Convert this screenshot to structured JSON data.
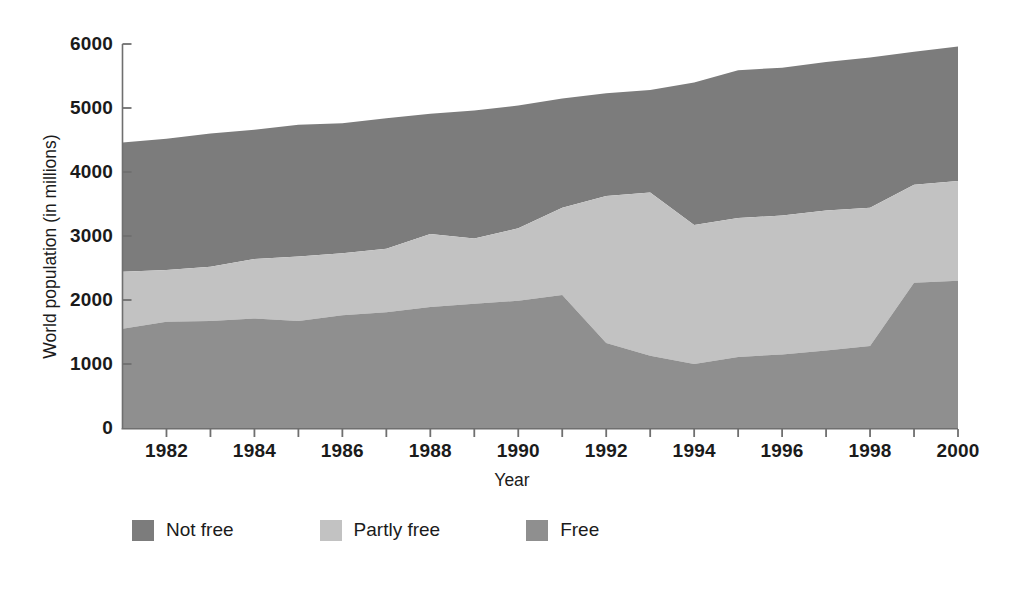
{
  "chart_data": {
    "type": "area",
    "title": "",
    "subtitle": "",
    "xlabel": "Year",
    "ylabel": "World population (in millions)",
    "stacked": true,
    "grid": false,
    "legend_position": "bottom",
    "xlim": [
      1981,
      2000
    ],
    "ylim": [
      0,
      6000
    ],
    "x_tick_labels": [
      "1982",
      "1984",
      "1986",
      "1988",
      "1990",
      "1992",
      "1994",
      "1996",
      "1998",
      "2000"
    ],
    "x_tick_values": [
      1982,
      1984,
      1986,
      1988,
      1990,
      1992,
      1994,
      1996,
      1998,
      2000
    ],
    "x_minor_tick_values": [
      1982,
      1983,
      1984,
      1985,
      1986,
      1987,
      1988,
      1989,
      1990,
      1991,
      1992,
      1993,
      1994,
      1995,
      1996,
      1997,
      1998,
      1999,
      2000
    ],
    "y_tick_labels": [
      "0",
      "1000",
      "2000",
      "3000",
      "4000",
      "5000",
      "6000"
    ],
    "y_tick_values": [
      0,
      1000,
      2000,
      3000,
      4000,
      5000,
      6000
    ],
    "x": [
      1981,
      1982,
      1983,
      1984,
      1985,
      1986,
      1987,
      1988,
      1989,
      1990,
      1991,
      1992,
      1993,
      1994,
      1995,
      1996,
      1997,
      1998,
      1999,
      2000
    ],
    "series": [
      {
        "name": "Free",
        "color": "#8f8f8f",
        "stack_order": 1,
        "values": [
          1550,
          1660,
          1670,
          1710,
          1670,
          1760,
          1810,
          1890,
          1940,
          1990,
          2080,
          1330,
          1130,
          1000,
          1110,
          1150,
          1210,
          1280,
          2270,
          2300
        ]
      },
      {
        "name": "Partly free",
        "color": "#c2c2c2",
        "stack_order": 2,
        "values": [
          890,
          810,
          850,
          930,
          1010,
          970,
          990,
          1140,
          1020,
          1130,
          1360,
          2295,
          2550,
          2170,
          2170,
          2170,
          2190,
          2160,
          1530,
          1560
        ]
      },
      {
        "name": "Not free",
        "color": "#7c7c7c",
        "stack_order": 3,
        "values": [
          2020,
          2050,
          2080,
          2020,
          2060,
          2030,
          2040,
          1880,
          2000,
          1920,
          1710,
          1605,
          1600,
          2230,
          2310,
          2310,
          2320,
          2350,
          2080,
          2100
        ]
      }
    ],
    "cumulative": {
      "free_top": [
        1550,
        1660,
        1670,
        1710,
        1670,
        1760,
        1810,
        1890,
        1940,
        1990,
        2080,
        1330,
        1130,
        1000,
        1110,
        1150,
        1210,
        1280,
        2270,
        2300
      ],
      "partly_free_top": [
        2440,
        2470,
        2520,
        2640,
        2680,
        2730,
        2800,
        3030,
        2960,
        3120,
        3440,
        3625,
        3680,
        3170,
        3280,
        3320,
        3400,
        3440,
        3800,
        3860
      ],
      "total": [
        4460,
        4520,
        4600,
        4660,
        4740,
        4760,
        4840,
        4910,
        4960,
        5040,
        5150,
        5230,
        5280,
        5400,
        5590,
        5630,
        5720,
        5790,
        5880,
        5960
      ]
    }
  },
  "axes": {
    "x_title": "Year",
    "y_title": "World population (in millions)"
  },
  "legend": {
    "items": [
      {
        "label": "Not free",
        "color": "#7c7c7c"
      },
      {
        "label": "Partly free",
        "color": "#c2c2c2"
      },
      {
        "label": "Free",
        "color": "#8f8f8f"
      }
    ]
  },
  "colors": {
    "axis": "#6f6f6f",
    "text": "#1b1b1b",
    "background": "#ffffff"
  }
}
